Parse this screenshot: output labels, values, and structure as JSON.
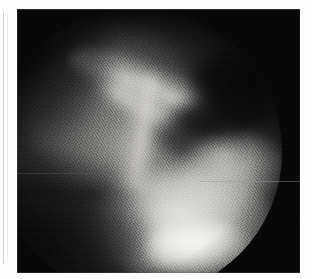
{
  "page": {
    "background_color": "#fdfdfd",
    "width": 312,
    "height": 279,
    "caption": ""
  },
  "margin_rule": {
    "name": "page-margin-rule",
    "color": "#d2d2d2"
  },
  "radiograph": {
    "title": "",
    "modality": "fluoroscopy",
    "body_region": "shoulder",
    "plate": {
      "x": 17,
      "y": 9,
      "width": 283,
      "height": 264,
      "background_color": "#060607"
    },
    "field_of_view": {
      "shape": "circle",
      "center_x": 138,
      "center_y": 152,
      "diameter": 288,
      "collimator_color": "#060607"
    },
    "tone": {
      "darkest": "#060607",
      "mid": "#7d7c7a",
      "brightest": "#fcfcfa"
    },
    "texture": {
      "kind": "halftone-dot-screen",
      "note": "scanned printed halftone"
    },
    "annotations": [],
    "overlay_text": ""
  }
}
